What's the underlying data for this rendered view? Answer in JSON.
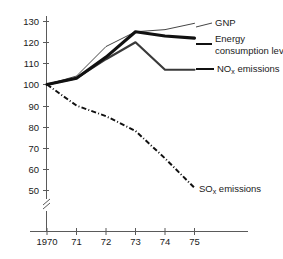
{
  "chart_data": {
    "type": "line",
    "title": "",
    "xlabel": "",
    "ylabel": "",
    "x": [
      1970,
      1971,
      1972,
      1973,
      1974,
      1975
    ],
    "xtick_labels": [
      "1970",
      "71",
      "72",
      "73",
      "74",
      "75"
    ],
    "ytick_labels": [
      "130",
      "120",
      "110",
      "100",
      "90",
      "80",
      "70",
      "60",
      "50"
    ],
    "ytick_values": [
      130,
      120,
      110,
      100,
      90,
      80,
      70,
      60,
      50
    ],
    "ylim": [
      45,
      133
    ],
    "grid": false,
    "axis_break": true,
    "legend_position": "inline-right",
    "series": [
      {
        "name": "GNP",
        "label": "GNP",
        "values": [
          100,
          104,
          118,
          125,
          126,
          129
        ],
        "style": "thin-solid",
        "color": "#303030"
      },
      {
        "name": "Energy consumption level",
        "label": "Energy consumption level",
        "label_line1": "Energy",
        "label_line2": "consumption level",
        "values": [
          100,
          103,
          113,
          125,
          123,
          122
        ],
        "style": "thick-solid",
        "color": "#111111"
      },
      {
        "name": "NOx emissions",
        "label": "NOx emissions",
        "label_prefix": "NO",
        "label_sub": "x",
        "label_suffix": " emissions",
        "values": [
          100,
          103,
          112,
          120,
          107,
          107
        ],
        "style": "medium-solid",
        "color": "#3a3a3a"
      },
      {
        "name": "SOx emissions",
        "label": "SOx emissions",
        "label_prefix": "SO",
        "label_sub": "x",
        "label_suffix": " emissions",
        "values": [
          100,
          90,
          85,
          78,
          65,
          51
        ],
        "style": "dash-dot",
        "color": "#111111"
      }
    ]
  },
  "axis": {
    "y_labels": {
      "v130": "130",
      "v120": "120",
      "v110": "110",
      "v100": "100",
      "v90": "90",
      "v80": "80",
      "v70": "70",
      "v60": "60",
      "v50": "50"
    },
    "x_labels": {
      "t1970": "1970",
      "t71": "71",
      "t72": "72",
      "t73": "73",
      "t74": "74",
      "t75": "75"
    }
  },
  "annotations": {
    "gnp": "GNP",
    "energy_line1": "Energy",
    "energy_line2": "consumption level",
    "nox_prefix": "NO",
    "nox_sub": "x",
    "nox_suffix": " emissions",
    "sox_prefix": "SO",
    "sox_sub": "x",
    "sox_suffix": " emissions"
  }
}
